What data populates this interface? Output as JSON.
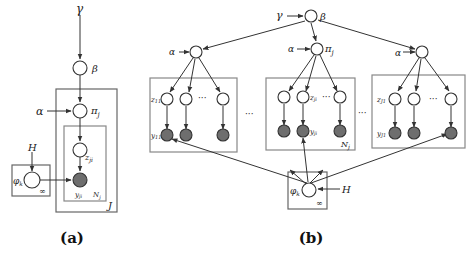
{
  "figure": {
    "panel_a": {
      "caption": "(a)",
      "labels": {
        "gamma": "γ",
        "beta": "β",
        "alpha": "α",
        "pi": "π",
        "pi_sub": "j",
        "z": "z",
        "z_sub": "ji",
        "y": "y",
        "y_sub": "ji",
        "H": "H",
        "phi": "φ",
        "phi_sub": "k",
        "infinity": "∞",
        "plate_inner": "N",
        "plate_inner_sub": "j",
        "plate_outer": "J"
      }
    },
    "panel_b": {
      "caption": "(b)",
      "labels": {
        "gamma": "γ",
        "beta": "β",
        "alpha_left": "α",
        "alpha_mid": "α",
        "alpha_right": "α",
        "pi": "π",
        "pi_sub": "j",
        "z_left": "z",
        "z_left_sub": "11",
        "y_left": "y",
        "y_left_sub": "11",
        "z_mid": "z",
        "z_mid_sub": "ji",
        "y_mid": "y",
        "y_mid_sub": "ji",
        "z_right": "z",
        "z_right_sub": "J1",
        "y_right": "y",
        "y_right_sub": "J1",
        "ellipsis": "···",
        "plate_mid": "N",
        "plate_mid_sub": "j",
        "phi": "φ",
        "phi_sub": "k",
        "H": "H",
        "infinity": "∞"
      }
    }
  }
}
